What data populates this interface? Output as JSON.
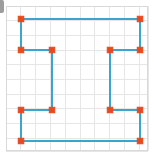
{
  "canvas": {
    "width": 154,
    "height": 157,
    "background_color": "#ffffff"
  },
  "grid_panel": {
    "x": 6,
    "y": 6,
    "width": 142,
    "height": 145,
    "border_color": "#d9d9d9",
    "grid_line_color": "#e6e6e6",
    "grid_spacing": 14.8,
    "grid_visible": "true"
  },
  "shape": {
    "name": "rectilinear-polygon",
    "description": "closed orthogonal polygon with H-like / I-beam outline",
    "stroke_color": "#3aa6d0",
    "stroke_width": 2,
    "fill": "none",
    "closed": "true",
    "vertex_count": 12
  },
  "markers": {
    "shape": "square",
    "fill_color": "#e8491d",
    "stroke_color": "#e8491d",
    "size": 5.5
  },
  "chart_data": {
    "type": "scatter",
    "title": "",
    "xlabel": "",
    "ylabel": "",
    "xlim": [
      6,
      148
    ],
    "ylim": [
      6,
      151
    ],
    "grid": "on",
    "legend": "none",
    "series": [
      {
        "name": "polygon-outline",
        "closed": true,
        "points": [
          {
            "x": 21,
            "y": 19
          },
          {
            "x": 140,
            "y": 19
          },
          {
            "x": 140,
            "y": 50
          },
          {
            "x": 110,
            "y": 50
          },
          {
            "x": 110,
            "y": 110
          },
          {
            "x": 140,
            "y": 110
          },
          {
            "x": 140,
            "y": 141
          },
          {
            "x": 21,
            "y": 141
          },
          {
            "x": 21,
            "y": 110
          },
          {
            "x": 52,
            "y": 110
          },
          {
            "x": 52,
            "y": 50
          },
          {
            "x": 21,
            "y": 50
          }
        ]
      }
    ],
    "gridlines_x": [
      6,
      20.8,
      35.6,
      50.4,
      65.2,
      80,
      94.8,
      109.6,
      124.4,
      139.2,
      148
    ],
    "gridlines_y": [
      6,
      20.7,
      35.4,
      50.1,
      64.8,
      79.5,
      94.2,
      108.9,
      123.6,
      138.3,
      151
    ]
  }
}
